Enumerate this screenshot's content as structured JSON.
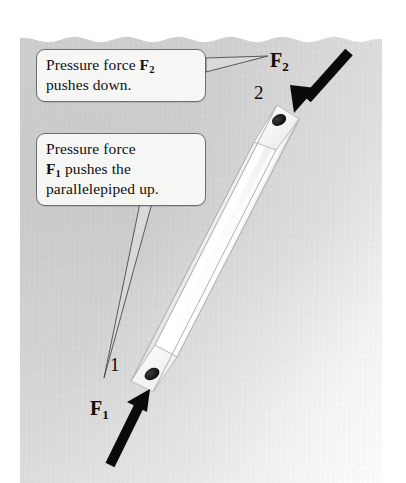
{
  "figure": {
    "background_color": "#cfcfcf",
    "page_color": "#d0d0d0",
    "ink_color": "#0d0c0b"
  },
  "callouts": [
    {
      "id": "callout-f2",
      "name": "callout-pressure-force-f2",
      "lines": [
        "Pressure force F2",
        "pushes down."
      ],
      "text_plain": "Pressure force F2 pushes down.",
      "line1_prefix": "Pressure force ",
      "line1_symbol": "F",
      "line1_subscript": "2",
      "line2": "pushes down.",
      "border_color": "#6d6d6d",
      "fill_color": "#f6f6f4"
    },
    {
      "id": "callout-f1",
      "name": "callout-pressure-force-f1",
      "lines": [
        "Pressure force",
        "F1 pushes the",
        "parallelepiped up."
      ],
      "text_plain": "Pressure force F1 pushes the parallelepiped up.",
      "line1": "Pressure force",
      "line2_symbol": "F",
      "line2_subscript": "1",
      "line2_suffix": " pushes the",
      "line3": "parallelepiped up.",
      "border_color": "#6d6d6d",
      "fill_color": "#f6f6f4"
    }
  ],
  "labels": {
    "force_top": {
      "symbol": "F",
      "subscript": "2",
      "text": "F2"
    },
    "force_bottom": {
      "symbol": "F",
      "subscript": "1",
      "text": "F1"
    },
    "vertex_top": "2",
    "vertex_bottom": "1"
  },
  "arrows": [
    {
      "name": "force-arrow-f2",
      "label": "F2",
      "direction": "down-left",
      "description": "Thick black arrow pushing down onto the top end face",
      "color": "#0a0a0a",
      "tail": [
        349,
        52
      ],
      "tip": [
        294,
        113
      ]
    },
    {
      "name": "force-arrow-f1",
      "label": "F1",
      "direction": "up-right",
      "description": "Thick black arrow pushing up onto the bottom end face",
      "color": "#0a0a0a",
      "tail": [
        110,
        465
      ],
      "tip": [
        150,
        389
      ]
    }
  ],
  "object": {
    "name": "parallelepiped-rod",
    "shape": "rectangular parallelepiped (long slender bar)",
    "orientation": "tilted, lower-left to upper-right",
    "top_end_label": "2",
    "bottom_end_label": "1",
    "face_light_color": "#fdfdfd",
    "face_shadow_color": "#dadada",
    "edge_color": "#b4b4b4"
  },
  "leaders": [
    {
      "name": "leader-line-f2",
      "from": "callout-f2",
      "to": "label-f2"
    },
    {
      "name": "leader-line-f1",
      "from": "callout-f1",
      "to": "vertex-1"
    }
  ]
}
